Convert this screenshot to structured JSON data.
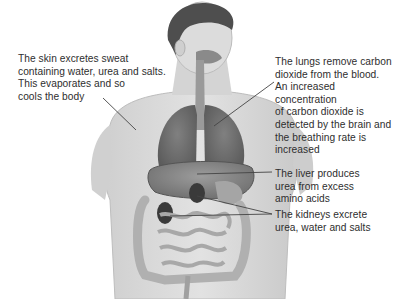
{
  "diagram": {
    "labels": {
      "skin": "The skin excretes sweat\ncontaining water, urea and salts.\nThis evaporates and so\ncools the body",
      "lungs": "The lungs remove carbon\ndioxide from the blood.\nAn increased concentration\nof carbon dioxide is\ndetected by the brain and\nthe breathing rate is\nincreased",
      "liver": "The liver produces\nurea from excess\namino acids",
      "kidneys": "The kidneys excrete\nurea, water and salts"
    },
    "colors": {
      "background": "#ffffff",
      "skin_tone": "#d9d9d9",
      "hair": "#4a4a4a",
      "lungs": "#6e6e6e",
      "liver": "#8a8a8a",
      "kidneys": "#3a3a3a",
      "intestines": "#b5b5b5",
      "leader_line": "#444444"
    }
  }
}
